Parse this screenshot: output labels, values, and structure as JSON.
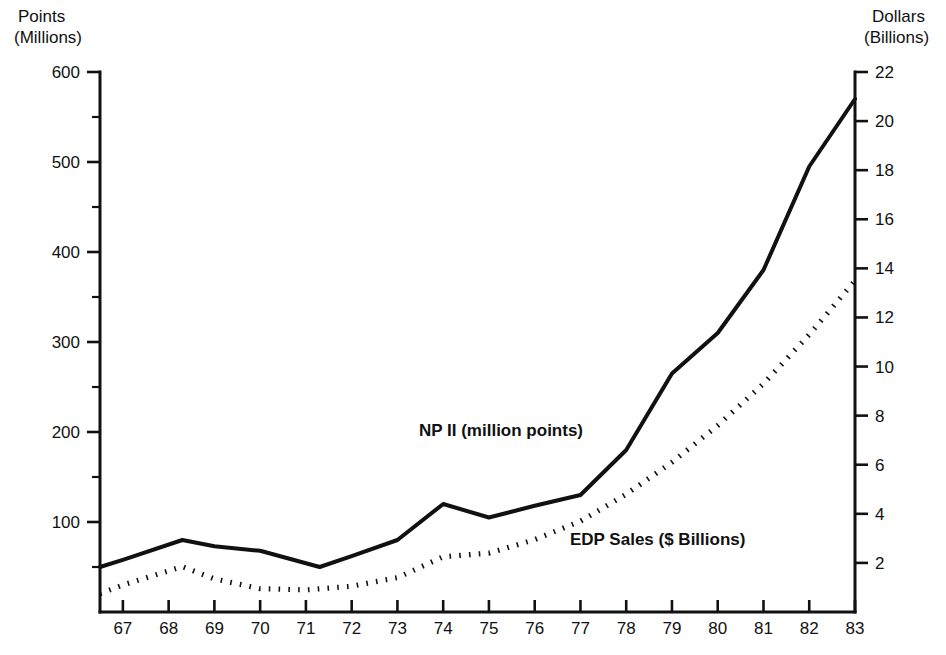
{
  "chart_data": {
    "type": "line",
    "title": "",
    "subtitle": "",
    "xlabel": "",
    "ylabel": "Points (Millions)",
    "y2label": "Dollars (Billions)",
    "left_axis": {
      "title_line1": "Points",
      "title_line2": "(Millions)",
      "ticks": [
        100,
        200,
        300,
        400,
        500,
        600
      ],
      "minor_ticks": [
        50,
        150,
        250,
        350,
        450,
        550
      ],
      "ylim": [
        0,
        600
      ],
      "label_unit": "Millions"
    },
    "right_axis": {
      "title_line1": "Dollars",
      "title_line2": "(Billions)",
      "ticks": [
        2,
        4,
        6,
        8,
        10,
        12,
        14,
        16,
        18,
        20,
        22
      ],
      "ylim": [
        0,
        22
      ],
      "label_unit": "Billions"
    },
    "x": [
      "67",
      "68",
      "69",
      "70",
      "71",
      "72",
      "73",
      "74",
      "75",
      "76",
      "77",
      "78",
      "79",
      "80",
      "81",
      "82",
      "83"
    ],
    "categories": [
      "67",
      "68",
      "69",
      "70",
      "71",
      "72",
      "73",
      "74",
      "75",
      "76",
      "77",
      "78",
      "79",
      "80",
      "81",
      "82",
      "83"
    ],
    "x_start_partial": "66",
    "grid": false,
    "legend_position": "inline-annotation",
    "series": [
      {
        "name": "NP II (million points)",
        "axis": "left",
        "style": "solid",
        "label": "NP II (million points)",
        "x": [
          "66.5",
          "67",
          "68.3",
          "69",
          "70",
          "71.3",
          "72",
          "73",
          "74",
          "75",
          "76",
          "77",
          "78",
          "79",
          "80",
          "81",
          "82",
          "83"
        ],
        "values": [
          50,
          58,
          80,
          73,
          68,
          50,
          62,
          80,
          120,
          105,
          118,
          130,
          180,
          265,
          310,
          380,
          495,
          570
        ]
      },
      {
        "name": "EDP Sales ($ Billions)",
        "axis": "right",
        "style": "dotted",
        "label": "EDP Sales ($ Billions)",
        "x": [
          "66.5",
          "67",
          "68.3",
          "69",
          "70",
          "71",
          "72",
          "73",
          "74",
          "75",
          "76",
          "77",
          "78",
          "79",
          "80",
          "81",
          "82",
          "83"
        ],
        "values": [
          0.75,
          1.1,
          1.85,
          1.35,
          0.95,
          0.9,
          1.05,
          1.4,
          2.25,
          2.4,
          2.95,
          3.7,
          4.8,
          6.1,
          7.6,
          9.3,
          11.3,
          13.5
        ]
      }
    ],
    "annotations": [
      {
        "text": "NP II (million points)",
        "x_px": 419,
        "y_px": 436,
        "anchor": "start"
      },
      {
        "text": "EDP Sales ($ Billions)",
        "x_px": 570,
        "y_px": 545,
        "anchor": "start"
      }
    ],
    "colors": {
      "ink": "#111111",
      "background": "#ffffff"
    }
  }
}
